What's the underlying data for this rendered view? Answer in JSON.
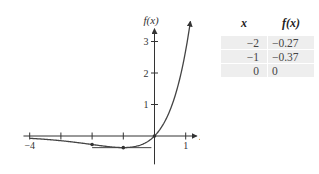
{
  "chart_data": {
    "type": "line",
    "title": "",
    "xlabel": "x",
    "ylabel": "f(x)",
    "xlim": [
      -4.2,
      1.35
    ],
    "ylim": [
      -0.9,
      3.4
    ],
    "x_ticks": [
      -4,
      -3,
      -2,
      -1,
      0,
      1
    ],
    "x_tick_labels": [
      {
        "value": -4,
        "label": "−4"
      },
      {
        "value": 1,
        "label": "1"
      }
    ],
    "y_ticks": [
      1,
      2,
      3
    ],
    "y_tick_labels": [
      {
        "value": 1,
        "label": "1"
      },
      {
        "value": 2,
        "label": "2"
      },
      {
        "value": 3,
        "label": "3"
      }
    ],
    "grid": false,
    "series": [
      {
        "name": "f(x) = x·e^x",
        "function": "x*exp(x)",
        "x_range": [
          -4,
          1.15
        ]
      }
    ],
    "marked_points": [
      {
        "x": -2,
        "y": -0.27
      },
      {
        "x": -1,
        "y": -0.37
      },
      {
        "x": 0,
        "y": 0
      }
    ],
    "tangent_line": {
      "y": -0.37,
      "x_range": [
        -2,
        -0.1
      ]
    }
  },
  "table": {
    "headers": [
      "x",
      "f(x)"
    ],
    "rows": [
      [
        "−2",
        "−0.27"
      ],
      [
        "−1",
        "−0.37"
      ],
      [
        "0",
        "0"
      ]
    ]
  }
}
